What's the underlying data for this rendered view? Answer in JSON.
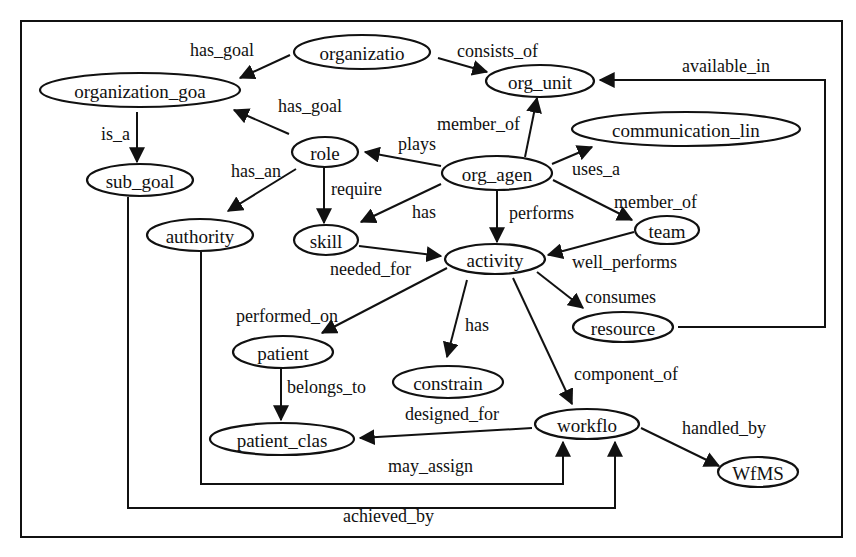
{
  "diagram": {
    "type": "ontology-graph",
    "frame": {
      "x": 21,
      "y": 21,
      "width": 821,
      "height": 516
    },
    "nodes": [
      {
        "id": "organizatio",
        "label": "organizatio",
        "cx": 362,
        "cy": 52,
        "rx": 68,
        "ry": 17
      },
      {
        "id": "org_unit",
        "label": "org_unit",
        "cx": 540,
        "cy": 81,
        "rx": 54,
        "ry": 16
      },
      {
        "id": "organization_goa",
        "label": "organization_goa",
        "cx": 140,
        "cy": 90,
        "rx": 100,
        "ry": 17
      },
      {
        "id": "role",
        "label": "role",
        "cx": 325,
        "cy": 152,
        "rx": 33,
        "ry": 15
      },
      {
        "id": "sub_goal",
        "label": "sub_goal",
        "cx": 140,
        "cy": 180,
        "rx": 53,
        "ry": 16
      },
      {
        "id": "communication_lin",
        "label": "communication_lin",
        "cx": 686,
        "cy": 129,
        "rx": 114,
        "ry": 17
      },
      {
        "id": "org_agen",
        "label": "org_agen",
        "cx": 497,
        "cy": 173,
        "rx": 55,
        "ry": 17
      },
      {
        "id": "authority",
        "label": "authority",
        "cx": 200,
        "cy": 235,
        "rx": 53,
        "ry": 16
      },
      {
        "id": "skill",
        "label": "skill",
        "cx": 326,
        "cy": 240,
        "rx": 32,
        "ry": 15
      },
      {
        "id": "team",
        "label": "team",
        "cx": 667,
        "cy": 230,
        "rx": 32,
        "ry": 14
      },
      {
        "id": "activity",
        "label": "activity",
        "cx": 495,
        "cy": 259,
        "rx": 50,
        "ry": 15
      },
      {
        "id": "resource",
        "label": "resource",
        "cx": 623,
        "cy": 327,
        "rx": 50,
        "ry": 15
      },
      {
        "id": "patient",
        "label": "patient",
        "cx": 283,
        "cy": 352,
        "rx": 50,
        "ry": 16
      },
      {
        "id": "constrain",
        "label": "constrain",
        "cx": 448,
        "cy": 382,
        "rx": 55,
        "ry": 16
      },
      {
        "id": "workflo",
        "label": "workflo",
        "cx": 587,
        "cy": 424,
        "rx": 52,
        "ry": 15
      },
      {
        "id": "patient_clas",
        "label": "patient_clas",
        "cx": 282,
        "cy": 439,
        "rx": 72,
        "ry": 16
      },
      {
        "id": "WfMS",
        "label": "WfMS",
        "cx": 758,
        "cy": 472,
        "rx": 40,
        "ry": 15
      }
    ],
    "edges": [
      {
        "id": "e1",
        "from": "organizatio",
        "to": "organization_goa",
        "label": "has_goal",
        "points": [
          [
            290,
            55
          ],
          [
            240,
            78
          ]
        ],
        "lx": 190,
        "ly": 56
      },
      {
        "id": "e2",
        "from": "organizatio",
        "to": "org_unit",
        "label": "consists_of",
        "points": [
          [
            438,
            58
          ],
          [
            487,
            72
          ]
        ],
        "lx": 457,
        "ly": 57
      },
      {
        "id": "e3",
        "from": "organization_goa",
        "to": "sub_goal",
        "label": "is_a",
        "points": [
          [
            137,
            112
          ],
          [
            137,
            162
          ]
        ],
        "lx": 101,
        "ly": 140
      },
      {
        "id": "e4",
        "from": "role",
        "to": "organization_goa",
        "label": "has_goal",
        "points": [
          [
            289,
            134
          ],
          [
            234,
            110
          ]
        ],
        "lx": 278,
        "ly": 112
      },
      {
        "id": "e5",
        "from": "role",
        "to": "authority",
        "label": "has_an",
        "points": [
          [
            296,
            169
          ],
          [
            228,
            211
          ]
        ],
        "lx": 231,
        "ly": 177
      },
      {
        "id": "e6",
        "from": "role",
        "to": "skill",
        "label": "require",
        "points": [
          [
            324,
            167
          ],
          [
            324,
            223
          ]
        ],
        "lx": 331,
        "ly": 195
      },
      {
        "id": "e7",
        "from": "org_agen",
        "to": "role",
        "label": "plays",
        "points": [
          [
            441,
            166
          ],
          [
            365,
            152
          ]
        ],
        "lx": 398,
        "ly": 150
      },
      {
        "id": "e8",
        "from": "org_agen",
        "to": "org_unit",
        "label": "member_of",
        "points": [
          [
            525,
            157
          ],
          [
            537,
            98
          ]
        ],
        "lx": 437,
        "ly": 130
      },
      {
        "id": "e9",
        "from": "org_agen",
        "to": "communication_lin",
        "label": "uses_a",
        "points": [
          [
            552,
            164
          ],
          [
            592,
            147
          ]
        ],
        "lx": 572,
        "ly": 175
      },
      {
        "id": "e10",
        "from": "org_agen",
        "to": "skill",
        "label": "has",
        "points": [
          [
            441,
            184
          ],
          [
            361,
            222
          ]
        ],
        "lx": 412,
        "ly": 218
      },
      {
        "id": "e11",
        "from": "org_agen",
        "to": "activity",
        "label": "performs",
        "points": [
          [
            497,
            191
          ],
          [
            497,
            242
          ]
        ],
        "lx": 509,
        "ly": 219
      },
      {
        "id": "e12",
        "from": "org_agen",
        "to": "team",
        "label": "member_of",
        "points": [
          [
            553,
            180
          ],
          [
            632,
            220
          ]
        ],
        "lx": 614,
        "ly": 208
      },
      {
        "id": "e13",
        "from": "skill",
        "to": "activity",
        "label": "needed_for",
        "points": [
          [
            359,
            246
          ],
          [
            441,
            256
          ]
        ],
        "lx": 330,
        "ly": 275
      },
      {
        "id": "e14",
        "from": "team",
        "to": "activity",
        "label": "well_performs",
        "points": [
          [
            634,
            232
          ],
          [
            548,
            255
          ]
        ],
        "lx": 572,
        "ly": 268
      },
      {
        "id": "e15",
        "from": "activity",
        "to": "patient",
        "label": "performed_on",
        "points": [
          [
            447,
            268
          ],
          [
            322,
            333
          ]
        ],
        "lx": 236,
        "ly": 322
      },
      {
        "id": "e16",
        "from": "activity",
        "to": "constrain",
        "label": "has",
        "points": [
          [
            467,
            280
          ],
          [
            447,
            357
          ]
        ],
        "lx": 465,
        "ly": 331
      },
      {
        "id": "e17",
        "from": "activity",
        "to": "resource",
        "label": "consumes",
        "points": [
          [
            537,
            272
          ],
          [
            583,
            308
          ]
        ],
        "lx": 585,
        "ly": 303
      },
      {
        "id": "e18",
        "from": "activity",
        "to": "workflo",
        "label": "component_of",
        "points": [
          [
            513,
            278
          ],
          [
            572,
            404
          ]
        ],
        "lx": 574,
        "ly": 380
      },
      {
        "id": "e19",
        "from": "resource",
        "to": "org_unit",
        "label": "available_in",
        "points": [
          [
            678,
            327
          ],
          [
            825,
            327
          ],
          [
            825,
            80
          ],
          [
            600,
            80
          ]
        ],
        "lx": 682,
        "ly": 72
      },
      {
        "id": "e20",
        "from": "patient",
        "to": "patient_clas",
        "label": "belongs_to",
        "points": [
          [
            281,
            369
          ],
          [
            281,
            420
          ]
        ],
        "lx": 287,
        "ly": 393
      },
      {
        "id": "e21",
        "from": "workflo",
        "to": "patient_clas",
        "label": "designed_for",
        "points": [
          [
            532,
            428
          ],
          [
            360,
            438
          ]
        ],
        "lx": 405,
        "ly": 420
      },
      {
        "id": "e22",
        "from": "workflo",
        "to": "WfMS",
        "label": "handled_by",
        "points": [
          [
            641,
            428
          ],
          [
            719,
            466
          ]
        ],
        "lx": 682,
        "ly": 434
      },
      {
        "id": "e23",
        "from": "authority",
        "to": "workflo",
        "label": "may_assign",
        "points": [
          [
            201,
            252
          ],
          [
            201,
            484
          ],
          [
            563,
            484
          ],
          [
            563,
            442
          ]
        ],
        "lx": 388,
        "ly": 472
      },
      {
        "id": "e24",
        "from": "sub_goal",
        "to": "workflo",
        "label": "achieved_by",
        "points": [
          [
            128,
            197
          ],
          [
            128,
            508
          ],
          [
            615,
            508
          ],
          [
            615,
            442
          ]
        ],
        "lx": 343,
        "ly": 522
      }
    ]
  }
}
